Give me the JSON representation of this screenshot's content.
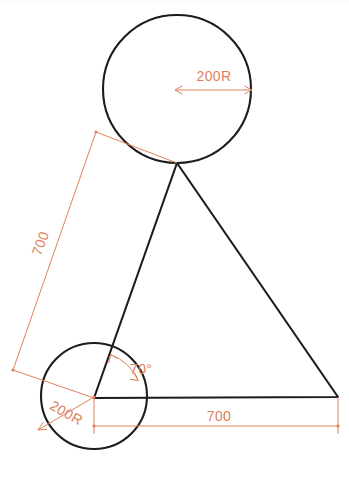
{
  "drawing": {
    "title": "Triangle with three corner circles - dimensioned sketch",
    "background_color": "#ffffff",
    "geometry_color": "#1c1c1c",
    "dimension_color": "#e0805c",
    "canvas": {
      "width": 349,
      "height": 483
    },
    "shapes": {
      "top_circle": {
        "name": "top-circle",
        "cx": 177,
        "cy": 89,
        "r": 74
      },
      "bottom_left_circle": {
        "name": "bottom-left-circle",
        "cx": 94,
        "cy": 396,
        "r": 53
      },
      "triangle": {
        "name": "triangle",
        "apex": {
          "x": 177,
          "y": 163
        },
        "base_left": {
          "x": 94,
          "y": 398
        },
        "base_right": {
          "x": 338,
          "y": 397
        }
      }
    },
    "dimensions": [
      {
        "id": "top-radius",
        "label": "200R",
        "kind": "radius",
        "text_x": 214,
        "text_y": 81,
        "rotation": 0
      },
      {
        "id": "left-side-length",
        "label": "700",
        "kind": "linear",
        "text_x": 45,
        "text_y": 245,
        "rotation": -70
      },
      {
        "id": "corner-angle",
        "label": "70°",
        "kind": "angular",
        "text_x": 130,
        "text_y": 374,
        "rotation": 0
      },
      {
        "id": "bottom-left-radius",
        "label": "200R",
        "kind": "radius",
        "text_x": 64,
        "text_y": 417,
        "rotation": 29
      },
      {
        "id": "base-length",
        "label": "700",
        "kind": "linear",
        "text_x": 219,
        "text_y": 421,
        "rotation": 0
      }
    ]
  }
}
